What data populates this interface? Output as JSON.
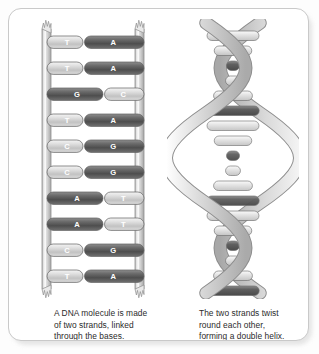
{
  "figure": {
    "name": "dna-structure-diagram",
    "panel": {
      "background": "#ffffff",
      "border_color": "#c9c9c9"
    }
  },
  "colors": {
    "rail": "#d6d6d6",
    "rail_edge": "#9a9a9a",
    "base_dark": "#5e5e5e",
    "base_light": "#d3d3d3",
    "base_letter": "#ffffff",
    "ribbon": "#c3c3c3",
    "ribbon_edge": "#8c8c8c",
    "text": "#2b2b2b"
  },
  "ladder": {
    "name": "dna-ladder",
    "rail_left_label": "sugar-phosphate-backbone-left",
    "rail_right_label": "sugar-phosphate-backbone-right",
    "base_pairs": [
      {
        "left": "T",
        "right": "A",
        "left_tone": "light",
        "right_tone": "dark",
        "left_long": false
      },
      {
        "left": "T",
        "right": "A",
        "left_tone": "light",
        "right_tone": "dark",
        "left_long": false
      },
      {
        "left": "G",
        "right": "C",
        "left_tone": "dark",
        "right_tone": "light",
        "left_long": true
      },
      {
        "left": "T",
        "right": "A",
        "left_tone": "light",
        "right_tone": "dark",
        "left_long": false
      },
      {
        "left": "C",
        "right": "G",
        "left_tone": "light",
        "right_tone": "dark",
        "left_long": false
      },
      {
        "left": "C",
        "right": "G",
        "left_tone": "light",
        "right_tone": "dark",
        "left_long": false
      },
      {
        "left": "A",
        "right": "T",
        "left_tone": "dark",
        "right_tone": "light",
        "left_long": true
      },
      {
        "left": "A",
        "right": "T",
        "left_tone": "dark",
        "right_tone": "light",
        "left_long": true
      },
      {
        "left": "C",
        "right": "G",
        "left_tone": "light",
        "right_tone": "dark",
        "left_long": false
      },
      {
        "left": "T",
        "right": "A",
        "left_tone": "light",
        "right_tone": "dark",
        "left_long": false
      }
    ]
  },
  "helix": {
    "name": "dna-double-helix",
    "strand_count": 2,
    "turns": 3
  },
  "captions": {
    "left": {
      "name": "caption-ladder",
      "lines": [
        "A DNA molecule is made",
        "of two strands, linked",
        "through the bases."
      ]
    },
    "right": {
      "name": "caption-helix",
      "lines": [
        "The two strands twist",
        "round each other,",
        "forming a double helix."
      ]
    }
  }
}
